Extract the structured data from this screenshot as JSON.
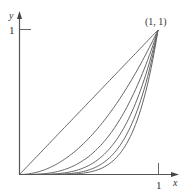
{
  "diagram": {
    "title": "",
    "axes": {
      "x_label": "x",
      "y_label": "y",
      "x_tick_label": "1",
      "y_tick_label": "1",
      "color": "#555555"
    },
    "point_label": "(1, 1)",
    "line_color": "#666666",
    "curves": [
      {
        "name": "diagonal",
        "power": 1
      },
      {
        "name": "curve-power-2",
        "power": 2
      },
      {
        "name": "curve-power-3",
        "power": 3
      },
      {
        "name": "curve-power-4",
        "power": 4
      },
      {
        "name": "curve-power-5",
        "power": 5
      },
      {
        "name": "curve-power-6",
        "power": 6
      }
    ]
  },
  "chart_data": {
    "type": "line",
    "title": "",
    "xlabel": "x",
    "ylabel": "y",
    "xlim": [
      0,
      1
    ],
    "ylim": [
      0,
      1
    ],
    "annotations": [
      "(1, 1)"
    ],
    "x_ticks": [
      "1"
    ],
    "y_ticks": [
      "1"
    ],
    "series": [
      {
        "name": "y = x",
        "function": "x^1"
      },
      {
        "name": "y = x^2",
        "function": "x^2"
      },
      {
        "name": "y = x^3",
        "function": "x^3"
      },
      {
        "name": "y = x^4",
        "function": "x^4"
      },
      {
        "name": "y = x^5",
        "function": "x^5"
      },
      {
        "name": "y = x^6",
        "function": "x^6"
      }
    ]
  }
}
